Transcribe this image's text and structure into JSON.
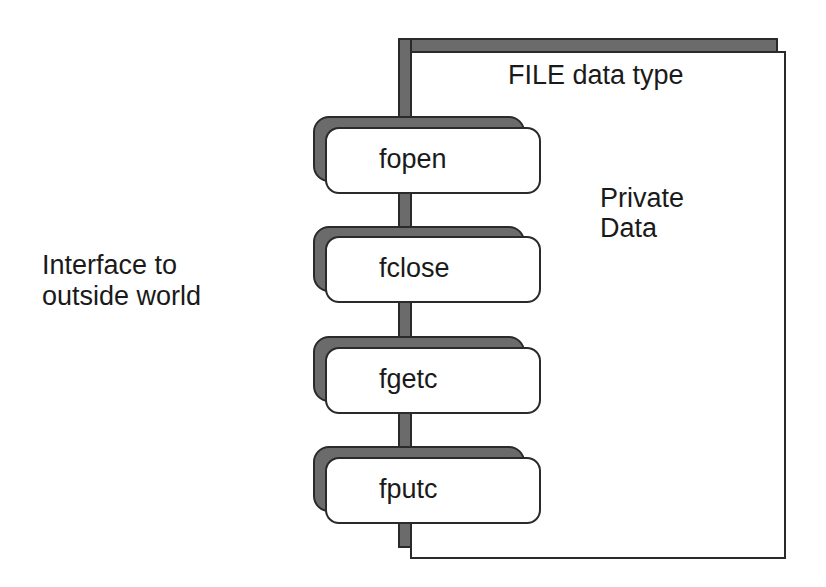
{
  "diagram": {
    "panel": {
      "title": "FILE data type",
      "private_label": [
        "Private",
        "Data"
      ]
    },
    "interface_label": [
      "Interface to",
      "outside world"
    ],
    "functions": [
      {
        "label": "fopen",
        "top": 127
      },
      {
        "label": "fclose",
        "top": 236
      },
      {
        "label": "fgetc",
        "top": 347
      },
      {
        "label": "fputc",
        "top": 457
      }
    ],
    "colors": {
      "shadow": "#6b6b6b",
      "stroke": "#2a2a2a",
      "fill": "#ffffff"
    }
  }
}
